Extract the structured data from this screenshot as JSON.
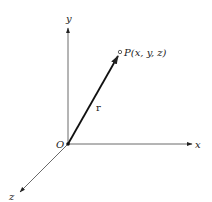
{
  "diagram": {
    "type": "3d-coordinate-system",
    "axes": {
      "x": {
        "label": "x"
      },
      "y": {
        "label": "y"
      },
      "z": {
        "label": "z"
      }
    },
    "origin": {
      "label": "O"
    },
    "vector": {
      "label": "r"
    },
    "point": {
      "label": "P(x, y, z)"
    },
    "colors": {
      "ink": "#222222",
      "background": "#ffffff"
    }
  }
}
